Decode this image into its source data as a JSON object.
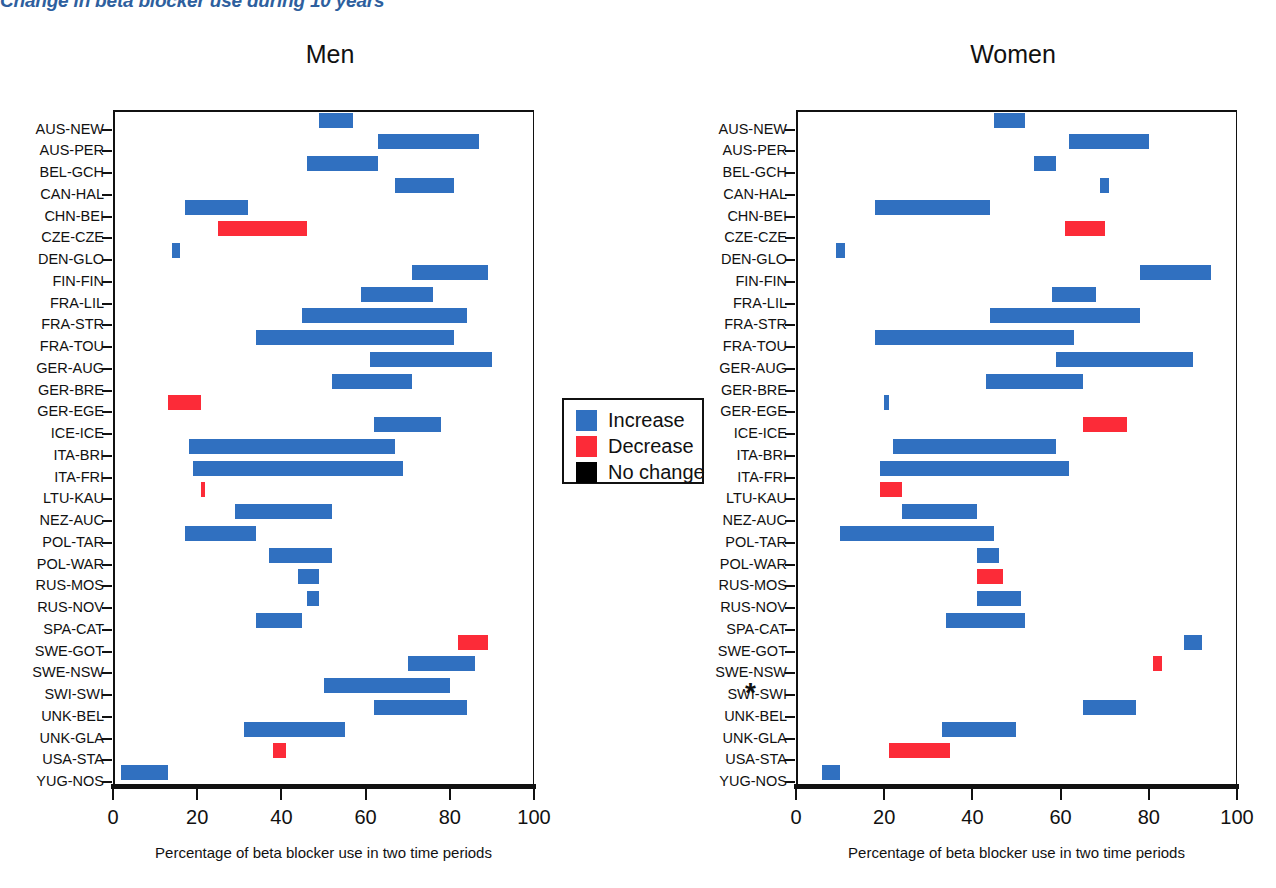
{
  "figure": {
    "title": "Change in beta blocker use during 10 years",
    "xaxis_title": "Percentage of beta blocker use in two time periods",
    "xticks": [
      "0",
      "20",
      "40",
      "60",
      "80",
      "100"
    ],
    "asterisk": "*",
    "colors": {
      "increase": "#3070c0",
      "decrease": "#fc2b38",
      "nochange": "#000000",
      "title": "#2e5f9e",
      "axis": "#111111"
    }
  },
  "legend": {
    "items": [
      {
        "label": "Increase",
        "color": "#3070c0"
      },
      {
        "label": "Decrease",
        "color": "#fc2b38"
      },
      {
        "label": "No change",
        "color": "#000000"
      }
    ]
  },
  "chart_data": {
    "type": "bar",
    "subtype": "range-bar",
    "title": "Change in beta blocker use during 10 years",
    "xlabel": "Percentage of beta blocker use in two time periods",
    "ylabel": "",
    "xlim": [
      0,
      100
    ],
    "xticks": [
      0,
      20,
      40,
      60,
      80,
      100
    ],
    "grid": false,
    "legend": [
      "Increase",
      "Decrease",
      "No change"
    ],
    "legend_position": "center",
    "panels": [
      {
        "name": "Men",
        "categories": [
          "AUS-NEW",
          "AUS-PER",
          "BEL-GCH",
          "CAN-HAL",
          "CHN-BEI",
          "CZE-CZE",
          "DEN-GLO",
          "FIN-FIN",
          "FRA-LIL",
          "FRA-STR",
          "FRA-TOU",
          "GER-AUG",
          "GER-BRE",
          "GER-EGE",
          "ICE-ICE",
          "ITA-BRI",
          "ITA-FRI",
          "LTU-KAU",
          "NEZ-AUC",
          "POL-TAR",
          "POL-WAR",
          "RUS-MOS",
          "RUS-NOV",
          "SPA-CAT",
          "SWE-GOT",
          "SWE-NSW",
          "SWI-SWI",
          "UNK-BEL",
          "UNK-GLA",
          "USA-STA",
          "YUG-NOS"
        ],
        "bars": [
          {
            "category": "AUS-NEW",
            "start": 49,
            "end": 57,
            "direction": "increase"
          },
          {
            "category": "AUS-PER",
            "start": 63,
            "end": 87,
            "direction": "increase"
          },
          {
            "category": "BEL-GCH",
            "start": 46,
            "end": 63,
            "direction": "increase"
          },
          {
            "category": "CAN-HAL",
            "start": 67,
            "end": 81,
            "direction": "increase"
          },
          {
            "category": "CHN-BEI",
            "start": 17,
            "end": 32,
            "direction": "increase"
          },
          {
            "category": "CZE-CZE",
            "start": 25,
            "end": 46,
            "direction": "decrease"
          },
          {
            "category": "DEN-GLO",
            "start": 14,
            "end": 16,
            "direction": "increase"
          },
          {
            "category": "FIN-FIN",
            "start": 71,
            "end": 89,
            "direction": "increase"
          },
          {
            "category": "FRA-LIL",
            "start": 59,
            "end": 76,
            "direction": "increase"
          },
          {
            "category": "FRA-STR",
            "start": 45,
            "end": 84,
            "direction": "increase"
          },
          {
            "category": "FRA-TOU",
            "start": 34,
            "end": 81,
            "direction": "increase"
          },
          {
            "category": "GER-AUG",
            "start": 61,
            "end": 90,
            "direction": "increase"
          },
          {
            "category": "GER-BRE",
            "start": 52,
            "end": 71,
            "direction": "increase"
          },
          {
            "category": "GER-EGE",
            "start": 13,
            "end": 21,
            "direction": "decrease"
          },
          {
            "category": "ICE-ICE",
            "start": 62,
            "end": 78,
            "direction": "increase"
          },
          {
            "category": "ITA-BRI",
            "start": 18,
            "end": 67,
            "direction": "increase"
          },
          {
            "category": "ITA-FRI",
            "start": 19,
            "end": 69,
            "direction": "increase"
          },
          {
            "category": "LTU-KAU",
            "start": 21,
            "end": 21.6,
            "direction": "decrease"
          },
          {
            "category": "NEZ-AUC",
            "start": 29,
            "end": 52,
            "direction": "increase"
          },
          {
            "category": "POL-TAR",
            "start": 17,
            "end": 34,
            "direction": "increase"
          },
          {
            "category": "POL-WAR",
            "start": 37,
            "end": 52,
            "direction": "increase"
          },
          {
            "category": "RUS-MOS",
            "start": 44,
            "end": 49,
            "direction": "increase"
          },
          {
            "category": "RUS-NOV",
            "start": 46,
            "end": 49,
            "direction": "increase"
          },
          {
            "category": "SPA-CAT",
            "start": 34,
            "end": 45,
            "direction": "increase"
          },
          {
            "category": "SWE-GOT",
            "start": 82,
            "end": 89,
            "direction": "decrease"
          },
          {
            "category": "SWE-NSW",
            "start": 70,
            "end": 86,
            "direction": "increase"
          },
          {
            "category": "SWI-SWI",
            "start": 50,
            "end": 80,
            "direction": "increase"
          },
          {
            "category": "UNK-BEL",
            "start": 62,
            "end": 84,
            "direction": "increase"
          },
          {
            "category": "UNK-GLA",
            "start": 31,
            "end": 55,
            "direction": "increase"
          },
          {
            "category": "USA-STA",
            "start": 38,
            "end": 41,
            "direction": "decrease"
          },
          {
            "category": "YUG-NOS",
            "start": 2,
            "end": 13,
            "direction": "increase"
          }
        ]
      },
      {
        "name": "Women",
        "categories": [
          "AUS-NEW",
          "AUS-PER",
          "BEL-GCH",
          "CAN-HAL",
          "CHN-BEI",
          "CZE-CZE",
          "DEN-GLO",
          "FIN-FIN",
          "FRA-LIL",
          "FRA-STR",
          "FRA-TOU",
          "GER-AUG",
          "GER-BRE",
          "GER-EGE",
          "ICE-ICE",
          "ITA-BRI",
          "ITA-FRI",
          "LTU-KAU",
          "NEZ-AUC",
          "POL-TAR",
          "POL-WAR",
          "RUS-MOS",
          "RUS-NOV",
          "SPA-CAT",
          "SWE-GOT",
          "SWE-NSW",
          "SWI-SWI",
          "UNK-BEL",
          "UNK-GLA",
          "USA-STA",
          "YUG-NOS"
        ],
        "bars": [
          {
            "category": "AUS-NEW",
            "start": 45,
            "end": 52,
            "direction": "increase"
          },
          {
            "category": "AUS-PER",
            "start": 62,
            "end": 80,
            "direction": "increase"
          },
          {
            "category": "BEL-GCH",
            "start": 54,
            "end": 59,
            "direction": "increase"
          },
          {
            "category": "CAN-HAL",
            "start": 69,
            "end": 71,
            "direction": "increase"
          },
          {
            "category": "CHN-BEI",
            "start": 18,
            "end": 44,
            "direction": "increase"
          },
          {
            "category": "CZE-CZE",
            "start": 61,
            "end": 70,
            "direction": "decrease"
          },
          {
            "category": "DEN-GLO",
            "start": 9,
            "end": 11,
            "direction": "increase"
          },
          {
            "category": "FIN-FIN",
            "start": 78,
            "end": 94,
            "direction": "increase"
          },
          {
            "category": "FRA-LIL",
            "start": 58,
            "end": 68,
            "direction": "increase"
          },
          {
            "category": "FRA-STR",
            "start": 44,
            "end": 78,
            "direction": "increase"
          },
          {
            "category": "FRA-TOU",
            "start": 18,
            "end": 63,
            "direction": "increase"
          },
          {
            "category": "GER-AUG",
            "start": 59,
            "end": 90,
            "direction": "increase"
          },
          {
            "category": "GER-BRE",
            "start": 43,
            "end": 65,
            "direction": "increase"
          },
          {
            "category": "GER-EGE",
            "start": 20,
            "end": 21,
            "direction": "increase"
          },
          {
            "category": "ICE-ICE",
            "start": 65,
            "end": 75,
            "direction": "decrease"
          },
          {
            "category": "ITA-BRI",
            "start": 22,
            "end": 59,
            "direction": "increase"
          },
          {
            "category": "ITA-FRI",
            "start": 19,
            "end": 62,
            "direction": "increase"
          },
          {
            "category": "LTU-KAU",
            "start": 19,
            "end": 24,
            "direction": "decrease"
          },
          {
            "category": "NEZ-AUC",
            "start": 24,
            "end": 41,
            "direction": "increase"
          },
          {
            "category": "POL-TAR",
            "start": 10,
            "end": 45,
            "direction": "increase"
          },
          {
            "category": "POL-WAR",
            "start": 41,
            "end": 46,
            "direction": "increase"
          },
          {
            "category": "RUS-MOS",
            "start": 41,
            "end": 47,
            "direction": "decrease"
          },
          {
            "category": "RUS-NOV",
            "start": 41,
            "end": 51,
            "direction": "increase"
          },
          {
            "category": "SPA-CAT",
            "start": 34,
            "end": 52,
            "direction": "increase"
          },
          {
            "category": "SWE-GOT",
            "start": 88,
            "end": 92,
            "direction": "increase"
          },
          {
            "category": "SWE-NSW",
            "start": 81,
            "end": 83,
            "direction": "decrease"
          },
          {
            "category": "SWI-SWI",
            "start": null,
            "end": null,
            "direction": "none"
          },
          {
            "category": "UNK-BEL",
            "start": 65,
            "end": 77,
            "direction": "increase"
          },
          {
            "category": "UNK-GLA",
            "start": 33,
            "end": 50,
            "direction": "increase"
          },
          {
            "category": "USA-STA",
            "start": 21,
            "end": 35,
            "direction": "decrease"
          },
          {
            "category": "YUG-NOS",
            "start": 6,
            "end": 10,
            "direction": "increase"
          }
        ]
      }
    ]
  }
}
